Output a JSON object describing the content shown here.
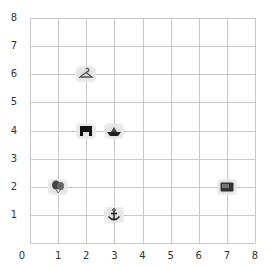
{
  "grid": {
    "x_min": 0,
    "x_max": 8,
    "y_min": 0,
    "y_max": 8,
    "x_ticks": [
      "0",
      "1",
      "2",
      "3",
      "4",
      "5",
      "6",
      "7",
      "8"
    ],
    "y_ticks": [
      "1",
      "2",
      "3",
      "4",
      "5",
      "6",
      "7",
      "8"
    ],
    "grid_color": "#c8c8c8"
  },
  "items": [
    {
      "name": "hanger",
      "x": 2,
      "y": 6
    },
    {
      "name": "stage",
      "x": 2,
      "y": 4
    },
    {
      "name": "boat",
      "x": 3,
      "y": 4
    },
    {
      "name": "balloons",
      "x": 1,
      "y": 2
    },
    {
      "name": "anchor",
      "x": 3,
      "y": 1
    },
    {
      "name": "wallet",
      "x": 7,
      "y": 2
    }
  ]
}
